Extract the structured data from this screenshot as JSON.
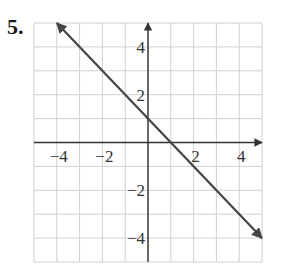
{
  "problem": {
    "number": "5."
  },
  "colors": {
    "grid": "#d0d0d0",
    "axis": "#333333",
    "line": "#444444",
    "text": "#333333"
  },
  "chart_data": {
    "type": "line",
    "title": "",
    "xlabel": "",
    "ylabel": "",
    "xlim": [
      -5,
      5
    ],
    "ylim": [
      -5,
      5
    ],
    "grid": true,
    "grid_step": 1,
    "x_tick_labels": [
      {
        "value": -4,
        "label": "−4"
      },
      {
        "value": -2,
        "label": "−2"
      },
      {
        "value": 2,
        "label": "2"
      },
      {
        "value": 4,
        "label": "4"
      }
    ],
    "y_tick_labels": [
      {
        "value": 4,
        "label": "4"
      },
      {
        "value": 2,
        "label": "2"
      },
      {
        "value": -2,
        "label": "−2"
      },
      {
        "value": -4,
        "label": "−4"
      }
    ],
    "series": [
      {
        "name": "y = -x + 1",
        "equation": "y = -x + 1",
        "slope": -1,
        "y_intercept": 1,
        "x": [
          -4,
          5
        ],
        "y": [
          5,
          -4
        ],
        "arrows_both_ends": true
      }
    ]
  }
}
